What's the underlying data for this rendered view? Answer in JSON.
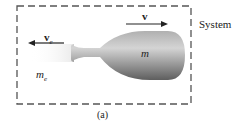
{
  "diagram": {
    "system_label": "System",
    "caption": "(a)",
    "rocket_mass_label": "m",
    "exhaust_mass_label": "m",
    "exhaust_mass_sub": "e",
    "rocket_velocity_label": "v",
    "exhaust_velocity_label": "v",
    "exhaust_velocity_sub": "e",
    "colors": {
      "border": "#555555",
      "rocket_light": "#c8c8c8",
      "rocket_dark": "#6a6a6a",
      "arrow": "#222222"
    }
  }
}
